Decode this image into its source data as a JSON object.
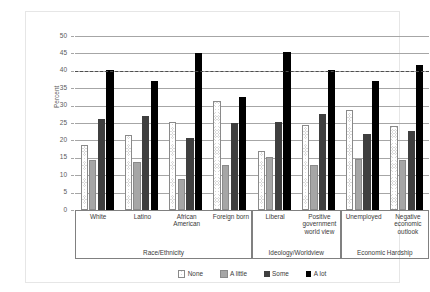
{
  "chart_data": {
    "type": "bar",
    "title": "",
    "xlabel": "",
    "ylabel": "Percent",
    "ylim": [
      0,
      50
    ],
    "ytick_step": 5,
    "yticks": [
      "0",
      "5",
      "10",
      "15",
      "20",
      "25",
      "30",
      "35",
      "40",
      "45",
      "50"
    ],
    "grid": true,
    "legend_position": "bottom",
    "reference_line": {
      "value": 40,
      "style": "dashed",
      "color": "#4d4d4d"
    },
    "categories": [
      "White",
      "Latino",
      "African American",
      "Foreign born",
      "Liberal",
      "Positive government world view",
      "Unemployed",
      "Negative economic outlook"
    ],
    "category_display": [
      [
        "White"
      ],
      [
        "Latino"
      ],
      [
        "African",
        "American"
      ],
      [
        "Foreign born"
      ],
      [
        "Liberal"
      ],
      [
        "Positive",
        "government",
        "world view"
      ],
      [
        "Unemployed"
      ],
      [
        "Negative",
        "economic",
        "outlook"
      ]
    ],
    "supergroups": [
      {
        "label": "Race/Ethnicity",
        "span": 4
      },
      {
        "label": "Ideology/Worldview",
        "span": 2
      },
      {
        "label": "Economic Hardship",
        "span": 2
      }
    ],
    "series": [
      {
        "name": "None",
        "pattern": "crosshatch",
        "color": "#d9d9d9",
        "values": [
          18.8,
          21.5,
          25.3,
          31.2,
          16.9,
          24.3,
          28.8,
          24.1
        ]
      },
      {
        "name": "A little",
        "pattern": "solid-gray",
        "color": "#a6a6a6",
        "values": [
          14.5,
          13.7,
          9.0,
          13.0,
          15.3,
          13.0,
          14.6,
          14.4
        ]
      },
      {
        "name": "Some",
        "pattern": "solid-dark",
        "color": "#3f3f3f",
        "values": [
          26.1,
          27.0,
          20.7,
          24.9,
          25.3,
          27.5,
          21.8,
          22.7
        ]
      },
      {
        "name": "A lot",
        "pattern": "solid-black",
        "color": "#000000",
        "values": [
          40.3,
          37.2,
          45.0,
          32.5,
          45.3,
          40.1,
          37.0,
          41.8
        ]
      }
    ]
  },
  "legend": {
    "items": [
      {
        "label": "None"
      },
      {
        "label": "A little"
      },
      {
        "label": "Some"
      },
      {
        "label": "A lot"
      }
    ]
  }
}
